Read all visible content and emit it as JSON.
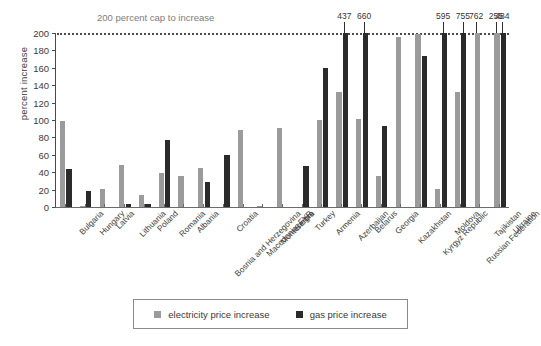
{
  "chart_data": {
    "type": "bar",
    "title": "",
    "annotation": "200 percent cap to increase",
    "xlabel": "",
    "ylabel": "percent increase",
    "ylim": [
      0,
      200
    ],
    "yticks": [
      0,
      20,
      40,
      60,
      80,
      100,
      120,
      140,
      160,
      180,
      200
    ],
    "grid": false,
    "cap_line_value": 200,
    "legend_position": "bottom",
    "colors": {
      "electricity price increase": "#9b9b9b",
      "gas price increase": "#2b2b2b",
      "cap_line": "#4d4d4d",
      "annotation_text": "#7d7d7d"
    },
    "categories": [
      "Bulgaria",
      "Hungary",
      "Latvia",
      "Lithuania",
      "Poland",
      "Romania",
      "Albania",
      "Bosnia and Herzegovina",
      "Croatia",
      "Macedonia, FYR",
      "Montenegro",
      "Serbia",
      "Turkey",
      "Armenia",
      "Azerbaijan",
      "Belarus",
      "Georgia",
      "Kazakhstan",
      "Kyrgyz Republic",
      "Moldova",
      "Russian Federation",
      "Tajikistan",
      "Ukraine"
    ],
    "series": [
      {
        "name": "electricity price increase",
        "color": "#9b9b9b",
        "values": [
          99,
          1,
          21,
          48,
          14,
          39,
          36,
          45,
          0,
          88,
          1,
          91,
          0,
          100,
          132,
          101,
          36,
          195,
          199,
          21,
          132,
          762,
          255
        ]
      },
      {
        "name": "gas price increase",
        "color": "#2b2b2b",
        "values": [
          44,
          18,
          0,
          4,
          4,
          77,
          0,
          29,
          60,
          0,
          0,
          0,
          47,
          160,
          437,
          660,
          93,
          0,
          174,
          595,
          755,
          0,
          484
        ]
      }
    ],
    "value_labels": [
      {
        "text": "437",
        "category": "Azerbaijan",
        "series": "gas price increase"
      },
      {
        "text": "660",
        "category": "Belarus",
        "series": "gas price increase"
      },
      {
        "text": "595",
        "category": "Moldova",
        "series": "gas price increase"
      },
      {
        "text": "755",
        "category": "Russian Federation",
        "series": "gas price increase"
      },
      {
        "text": "762",
        "category": "Tajikistan",
        "series": "electricity price increase"
      },
      {
        "text": "255",
        "category": "Ukraine",
        "series": "electricity price increase"
      },
      {
        "text": "484",
        "category": "Ukraine",
        "series": "gas price increase"
      }
    ]
  },
  "legend": {
    "items": [
      {
        "label": "electricity price increase",
        "key": "elec"
      },
      {
        "label": "gas price increase",
        "key": "gas"
      }
    ]
  }
}
